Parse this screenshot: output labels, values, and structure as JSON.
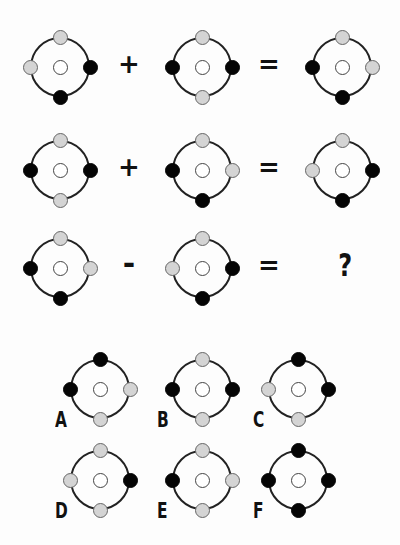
{
  "colors": {
    "black": "#050505",
    "gray": "#d4d4d4",
    "white": "#ffffff",
    "ring": "#222222"
  },
  "position_order": [
    "top",
    "right",
    "bottom",
    "left"
  ],
  "equations": [
    {
      "operand1": {
        "top": "gray",
        "right": "black",
        "bottom": "black",
        "left": "gray",
        "center": "white"
      },
      "operator": "+",
      "operand2": {
        "top": "gray",
        "right": "black",
        "bottom": "gray",
        "left": "black",
        "center": "white"
      },
      "equals": "=",
      "result": {
        "top": "gray",
        "right": "gray",
        "bottom": "black",
        "left": "black",
        "center": "white"
      }
    },
    {
      "operand1": {
        "top": "gray",
        "right": "black",
        "bottom": "gray",
        "left": "black",
        "center": "white"
      },
      "operator": "+",
      "operand2": {
        "top": "gray",
        "right": "gray",
        "bottom": "black",
        "left": "black",
        "center": "white"
      },
      "equals": "=",
      "result": {
        "top": "gray",
        "right": "black",
        "bottom": "black",
        "left": "gray",
        "center": "white"
      }
    },
    {
      "operand1": {
        "top": "gray",
        "right": "gray",
        "bottom": "black",
        "left": "black",
        "center": "white"
      },
      "operator": "-",
      "operand2": {
        "top": "gray",
        "right": "black",
        "bottom": "black",
        "left": "gray",
        "center": "white"
      },
      "equals": "=",
      "result": "?"
    }
  ],
  "options": [
    {
      "label": "A",
      "top": "black",
      "right": "gray",
      "bottom": "gray",
      "left": "black",
      "center": "white"
    },
    {
      "label": "B",
      "top": "gray",
      "right": "black",
      "bottom": "gray",
      "left": "black",
      "center": "white"
    },
    {
      "label": "C",
      "top": "black",
      "right": "black",
      "bottom": "gray",
      "left": "gray",
      "center": "white"
    },
    {
      "label": "D",
      "top": "gray",
      "right": "black",
      "bottom": "gray",
      "left": "gray",
      "center": "white"
    },
    {
      "label": "E",
      "top": "gray",
      "right": "gray",
      "bottom": "gray",
      "left": "black",
      "center": "white"
    },
    {
      "label": "F",
      "top": "black",
      "right": "black",
      "bottom": "black",
      "left": "black",
      "center": "white"
    }
  ]
}
